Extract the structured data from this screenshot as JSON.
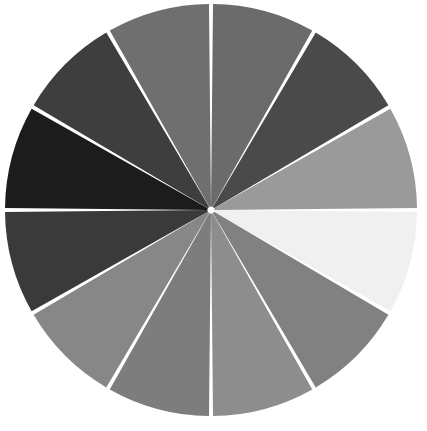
{
  "canvas": {
    "width": 427,
    "height": 431,
    "background": "#ffffff",
    "title": "Grayscale Segmented Color Wheel"
  },
  "wheel": {
    "center_x": 211,
    "center_y": 210,
    "radius": 206,
    "segment_count": 12,
    "segment_angle_degrees": 30,
    "start_angle_degrees": 0,
    "divider_color": "#ffffff",
    "divider_width_px": 4,
    "outline_color": "#ffffff"
  },
  "chart_data": {
    "type": "pie",
    "subtitle": "",
    "xlabel": "",
    "ylabel": "",
    "grid": false,
    "legend": "none",
    "equal_slices": true,
    "total_degrees": 360,
    "categories": [
      "12-1 o'clock",
      "1-2 o'clock",
      "2-3 o'clock",
      "3-4 o'clock",
      "4-5 o'clock",
      "5-6 o'clock",
      "6-7 o'clock",
      "7-8 o'clock",
      "8-9 o'clock",
      "9-10 o'clock",
      "10-11 o'clock",
      "11-12 o'clock"
    ],
    "values": [
      30,
      30,
      30,
      30,
      30,
      30,
      30,
      30,
      30,
      30,
      30,
      30
    ],
    "colors": [
      "#6b6b6b",
      "#4a4a4a",
      "#9a9a9a",
      "#f0f0f0",
      "#818181",
      "#8d8d8d",
      "#7d7d7d",
      "#878787",
      "#3a3a3a",
      "#1c1c1c",
      "#3e3e3e",
      "#6f6f6f"
    ],
    "slices": [
      {
        "index": 1,
        "label": "segment-01",
        "start_deg": 0,
        "end_deg": 30,
        "sweep_deg": 30,
        "color": "#6b6b6b",
        "gray_level": 107
      },
      {
        "index": 2,
        "label": "segment-02",
        "start_deg": 30,
        "end_deg": 60,
        "sweep_deg": 30,
        "color": "#4a4a4a",
        "gray_level": 74
      },
      {
        "index": 3,
        "label": "segment-03",
        "start_deg": 60,
        "end_deg": 90,
        "sweep_deg": 30,
        "color": "#9a9a9a",
        "gray_level": 154
      },
      {
        "index": 4,
        "label": "segment-04",
        "start_deg": 90,
        "end_deg": 120,
        "sweep_deg": 30,
        "color": "#f0f0f0",
        "gray_level": 240
      },
      {
        "index": 5,
        "label": "segment-05",
        "start_deg": 120,
        "end_deg": 150,
        "sweep_deg": 30,
        "color": "#818181",
        "gray_level": 129
      },
      {
        "index": 6,
        "label": "segment-06",
        "start_deg": 150,
        "end_deg": 180,
        "sweep_deg": 30,
        "color": "#8d8d8d",
        "gray_level": 141
      },
      {
        "index": 7,
        "label": "segment-07",
        "start_deg": 180,
        "end_deg": 210,
        "sweep_deg": 30,
        "color": "#7d7d7d",
        "gray_level": 125
      },
      {
        "index": 8,
        "label": "segment-08",
        "start_deg": 210,
        "end_deg": 240,
        "sweep_deg": 30,
        "color": "#878787",
        "gray_level": 135
      },
      {
        "index": 9,
        "label": "segment-09",
        "start_deg": 240,
        "end_deg": 270,
        "sweep_deg": 30,
        "color": "#3a3a3a",
        "gray_level": 58
      },
      {
        "index": 10,
        "label": "segment-10",
        "start_deg": 270,
        "end_deg": 300,
        "sweep_deg": 30,
        "color": "#1c1c1c",
        "gray_level": 28
      },
      {
        "index": 11,
        "label": "segment-11",
        "start_deg": 300,
        "end_deg": 330,
        "sweep_deg": 30,
        "color": "#3e3e3e",
        "gray_level": 62
      },
      {
        "index": 12,
        "label": "segment-12",
        "start_deg": 330,
        "end_deg": 360,
        "sweep_deg": 30,
        "color": "#6f6f6f",
        "gray_level": 111
      }
    ]
  }
}
